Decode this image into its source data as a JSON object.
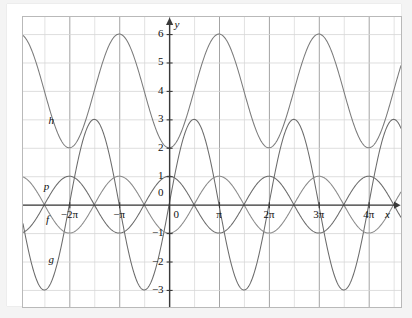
{
  "figure": {
    "background": "#f4f4f4",
    "paper_color": "#ffffff",
    "frame_color": "#b9b9b9",
    "grid_color": "#d6d6d6",
    "grid_major_color": "#9a9a9a",
    "axis_color": "#3a3a3a",
    "curve_color": "#6f6f6f",
    "curve_color_dark": "#555555"
  },
  "axes": {
    "x_label": "x",
    "y_label": "y",
    "origin_label": "0",
    "x_ticks": [
      {
        "label": "−2π",
        "value": -6.2832
      },
      {
        "label": "−π",
        "value": -3.1416
      },
      {
        "label": "π",
        "value": 3.1416
      },
      {
        "label": "2π",
        "value": 6.2832
      },
      {
        "label": "3π",
        "value": 9.4248
      },
      {
        "label": "4π",
        "value": 12.5664
      }
    ],
    "y_ticks": [
      {
        "label": "6",
        "value": 6
      },
      {
        "label": "5",
        "value": 5
      },
      {
        "label": "4",
        "value": 4
      },
      {
        "label": "3",
        "value": 3
      },
      {
        "label": "2",
        "value": 2
      },
      {
        "label": "1",
        "value": 1
      },
      {
        "label": "0",
        "value": 0
      },
      {
        "label": "−1",
        "value": -1
      },
      {
        "label": "−2",
        "value": -2
      },
      {
        "label": "−3",
        "value": -3
      }
    ],
    "xlim": [
      -9.2,
      14.6
    ],
    "ylim": [
      -3.6,
      6.6
    ],
    "grid": true,
    "grid_step_x_pi": 0.5,
    "grid_step_y": 1
  },
  "chart_data": {
    "type": "line",
    "title": "",
    "xlabel": "x",
    "ylabel": "y",
    "xlim": [
      -9.2,
      14.6
    ],
    "ylim": [
      -3.6,
      6.6
    ],
    "grid": true,
    "legend": "inline-curve-labels",
    "series": [
      {
        "name": "h",
        "label": "h",
        "expression": "4 - 2*cos(x)",
        "amplitude": 2,
        "midline": 4,
        "period": 6.2832,
        "ymin": 2,
        "ymax": 6,
        "label_x": -7.6,
        "label_y": 2.95,
        "color": "#7a7a7a"
      },
      {
        "name": "g",
        "label": "g",
        "expression": "3*sin(x)",
        "amplitude": 3,
        "midline": 0,
        "period": 6.2832,
        "ymin": -3,
        "ymax": 3,
        "label_x": -7.6,
        "label_y": -1.95,
        "color": "#6b6b6b"
      },
      {
        "name": "p",
        "label": "p",
        "expression": "-cos(x)",
        "amplitude": 1,
        "midline": 0,
        "period": 6.2832,
        "ymin": -1,
        "ymax": 1,
        "label_x": -7.9,
        "label_y": 0.62,
        "color": "#8a8a8a"
      },
      {
        "name": "f",
        "label": "f",
        "expression": "cos(x)",
        "amplitude": 1,
        "midline": 0,
        "period": 6.2832,
        "ymin": -1,
        "ymax": 1,
        "label_x": -7.75,
        "label_y": -0.55,
        "color": "#6b6b6b"
      }
    ]
  }
}
